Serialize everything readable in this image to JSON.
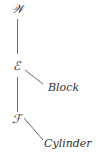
{
  "diagram": {
    "type": "tree",
    "nodes": [
      {
        "id": "W",
        "label": "𝒲"
      },
      {
        "id": "E",
        "label": "ℰ"
      },
      {
        "id": "F",
        "label": "ℱ"
      }
    ],
    "leaves": [
      {
        "id": "block",
        "label": "Block",
        "parent": "E"
      },
      {
        "id": "cylinder",
        "label": "Cylinder",
        "parent": "F"
      }
    ],
    "edges": [
      [
        "W",
        "E"
      ],
      [
        "E",
        "F"
      ],
      [
        "E",
        "block"
      ],
      [
        "F",
        "cylinder"
      ]
    ]
  }
}
